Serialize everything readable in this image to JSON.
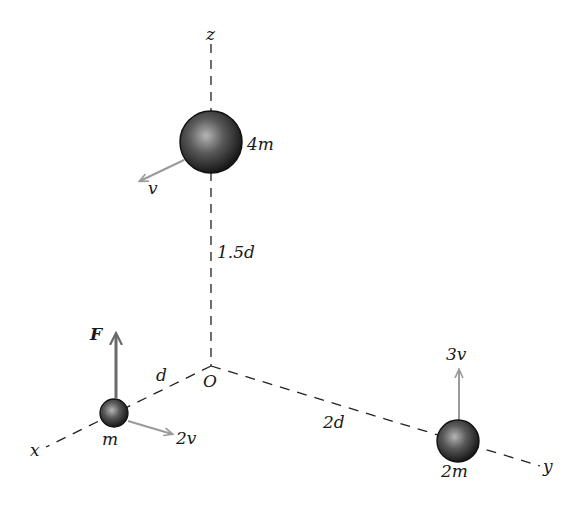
{
  "diagram": {
    "axes": {
      "x_label": "x",
      "y_label": "y",
      "z_label": "z",
      "origin_label": "O"
    },
    "masses": [
      {
        "id": "top",
        "label": "4m",
        "velocity_label": "v",
        "position_desc": "on z-axis"
      },
      {
        "id": "left",
        "label": "m",
        "velocity_label": "2v",
        "force_label": "F",
        "position_desc": "on x-axis"
      },
      {
        "id": "right",
        "label": "2m",
        "velocity_label": "3v",
        "position_desc": "on y-axis"
      }
    ],
    "distances": {
      "z": "1.5d",
      "x": "d",
      "y": "2d"
    },
    "colors": {
      "axis": "#222222",
      "vector_gray": "#9a9a9a",
      "force": "#6a6a6a",
      "sphere_dark": "#1e1e1e",
      "sphere_light": "#a0a0a0"
    }
  }
}
